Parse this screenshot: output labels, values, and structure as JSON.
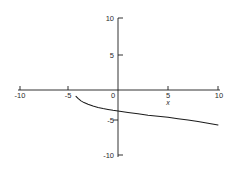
{
  "chart_data": {
    "type": "line",
    "title": "",
    "subtitle": "",
    "xlabel": "x",
    "ylabel": "",
    "xlim": [
      -10,
      10
    ],
    "ylim": [
      -10,
      10
    ],
    "grid": false,
    "legend": null,
    "x_ticks": [
      -10,
      -5,
      0,
      5,
      10
    ],
    "x_tick_labels": [
      "-10",
      "-5",
      "0",
      "5",
      "10"
    ],
    "y_ticks": [
      -10,
      -5,
      5,
      10
    ],
    "y_tick_labels": [
      "-10",
      "-5",
      "5",
      "10"
    ],
    "origin_label": "0",
    "series": [
      {
        "name": "curve",
        "color": "#1c1c1c",
        "x": [
          -4.2,
          -4.0,
          -3.7,
          -3.4,
          -3.0,
          -2.5,
          -2.0,
          -1.5,
          -1.0,
          -0.5,
          0.0,
          1.0,
          2.0,
          3.0,
          4.0,
          5.0,
          6.0,
          7.0,
          8.0,
          9.0,
          10.0
        ],
        "y": [
          -0.9,
          -1.2,
          -1.55,
          -1.8,
          -2.05,
          -2.3,
          -2.5,
          -2.65,
          -2.78,
          -2.9,
          -3.0,
          -3.2,
          -3.4,
          -3.6,
          -3.75,
          -3.9,
          -4.1,
          -4.3,
          -4.5,
          -4.75,
          -5.0
        ]
      }
    ]
  },
  "axes": {
    "x_axis_name": "x-axis",
    "y_axis_name": "y-axis"
  }
}
